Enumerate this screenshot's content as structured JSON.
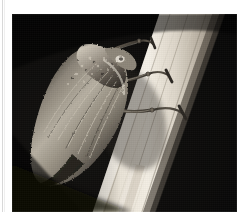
{
  "page": {
    "background_color": "#ffffff",
    "gutter_rule_color": "#d8d8d8",
    "caption_top_partial": "BUFFALO TREEHOPPER ON A LEAF STALK"
  },
  "plate": {
    "name": "insect-photograph",
    "media": "black-and-white halftone photograph",
    "background_color": "#0b0b0b",
    "subject": "treehopper insect clinging to a plant stem",
    "stem": {
      "description": "bright pale plant stem running diagonally from upper right to lower center",
      "highlight_color": "#efe9dd",
      "midtone_color": "#c3bcae",
      "shadow_color": "#7e776c"
    },
    "insect": {
      "description": "dark mottled treehopper in left profile with folded veined wing",
      "body_color": "#9a948a",
      "dark_color": "#23201d",
      "highlight_color": "#e2ddd2",
      "leg_count_visible": 3,
      "eye_highlight_color": "#f2efe6"
    }
  },
  "colors": {
    "paper": "#ffffff",
    "photo_black": "#0a0a0a",
    "photo_white": "#f4f0e7",
    "caption_gray": "#b9b9b9"
  }
}
